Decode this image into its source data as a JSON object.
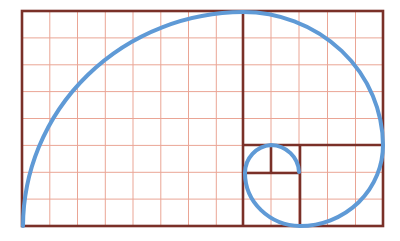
{
  "diagram": {
    "type": "golden-spiral",
    "colors": {
      "background": "#ffffff",
      "grid": "#eaa595",
      "border": "#7a3028",
      "spiral": "#5f9ad6"
    },
    "frame": {
      "x": 22,
      "y": 11,
      "width": 361,
      "height": 215
    },
    "grid": {
      "columns": 13,
      "rows": 8
    },
    "squares": [
      {
        "x": 22,
        "y": 11,
        "width": 221,
        "height": 215
      },
      {
        "x": 243,
        "y": 11,
        "width": 140,
        "height": 134
      },
      {
        "x": 300,
        "y": 145,
        "width": 83,
        "height": 81
      },
      {
        "x": 243,
        "y": 173,
        "width": 57,
        "height": 53
      },
      {
        "x": 243,
        "y": 145,
        "width": 28,
        "height": 28
      },
      {
        "x": 271,
        "y": 145,
        "width": 29,
        "height": 28
      }
    ]
  }
}
